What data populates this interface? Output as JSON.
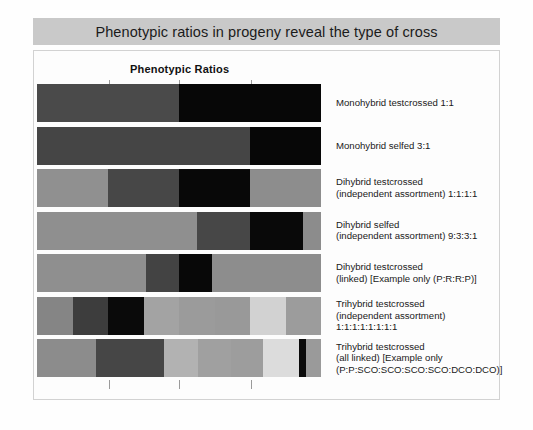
{
  "title": "Phenotypic ratios in progeny reveal the type of cross",
  "chart_heading": "Phenotypic Ratios",
  "colors": {
    "banner_bg": "#c9c9c9",
    "panel_bg": "#fdfdfd",
    "panel_border": "#d2d2d2",
    "tick": "#9a9a9a",
    "text": "#1a1a1a"
  },
  "axis": {
    "tick_positions_px": [
      108,
      178,
      250
    ],
    "bar_left_px": 36,
    "bar_right_px": 320,
    "tick_labels": []
  },
  "chart_data": {
    "type": "bar",
    "orientation": "horizontal-stacked",
    "title": "Phenotypic Ratios",
    "xlabel": "",
    "ylabel": "",
    "grid": false,
    "legend": "none",
    "categories": [
      "Monohybrid testcrossed 1:1",
      "Monohybrid selfed 3:1",
      "Dihybrid testcrossed (independent assortment) 1:1:1:1",
      "Dihybrid selfed (independent assortment) 9:3:3:1",
      "Dihybrid testcrossed (linked) [Example only (P:R:R:P)]",
      "Trihybrid testcrossed (independent assortment) 1:1:1:1:1:1:1:1",
      "Trihybrid testcrossed (all linked) [Example only (P:P:SCO:SCO:SCO:SCO:DCO:DCO)]"
    ],
    "rows": [
      {
        "label_lines": [
          "Monohybrid testcrossed 1:1"
        ],
        "ratio": "1:1",
        "segments": [
          {
            "fraction": 0.5,
            "color": "#4a4a4a"
          },
          {
            "fraction": 0.5,
            "color": "#070707"
          }
        ]
      },
      {
        "label_lines": [
          "Monohybrid selfed 3:1"
        ],
        "ratio": "3:1",
        "segments": [
          {
            "fraction": 0.75,
            "color": "#454545"
          },
          {
            "fraction": 0.25,
            "color": "#070707"
          }
        ]
      },
      {
        "label_lines": [
          "Dihybrid testcrossed",
          "(independent assortment) 1:1:1:1"
        ],
        "ratio": "1:1:1:1",
        "segments": [
          {
            "fraction": 0.25,
            "color": "#909090"
          },
          {
            "fraction": 0.25,
            "color": "#474747"
          },
          {
            "fraction": 0.25,
            "color": "#080808"
          },
          {
            "fraction": 0.25,
            "color": "#8d8d8d"
          }
        ]
      },
      {
        "label_lines": [
          "Dihybrid selfed",
          "(independent assortment) 9:3:3:1"
        ],
        "ratio": "9:3:3:1",
        "segments": [
          {
            "fraction": 0.5625,
            "color": "#8f8f8f"
          },
          {
            "fraction": 0.1875,
            "color": "#474747"
          },
          {
            "fraction": 0.1875,
            "color": "#090909"
          },
          {
            "fraction": 0.0625,
            "color": "#8c8c8c"
          }
        ]
      },
      {
        "label_lines": [
          "Dihybrid testcrossed",
          "(linked) [Example only (P:R:R:P)]"
        ],
        "ratio": "P:R:R:P",
        "segments": [
          {
            "fraction": 0.385,
            "color": "#8f8f8f"
          },
          {
            "fraction": 0.115,
            "color": "#434343"
          },
          {
            "fraction": 0.115,
            "color": "#080808"
          },
          {
            "fraction": 0.385,
            "color": "#8d8d8d"
          }
        ]
      },
      {
        "label_lines": [
          "Trihybrid testcrossed",
          "(independent assortment)",
          "1:1:1:1:1:1:1:1"
        ],
        "ratio": "1:1:1:1:1:1:1:1",
        "segments": [
          {
            "fraction": 0.125,
            "color": "#858585"
          },
          {
            "fraction": 0.125,
            "color": "#3d3d3d"
          },
          {
            "fraction": 0.125,
            "color": "#0a0a0a"
          },
          {
            "fraction": 0.125,
            "color": "#a3a3a3"
          },
          {
            "fraction": 0.125,
            "color": "#9b9b9b"
          },
          {
            "fraction": 0.125,
            "color": "#999999"
          },
          {
            "fraction": 0.125,
            "color": "#d2d2d2"
          },
          {
            "fraction": 0.125,
            "color": "#9c9c9c"
          }
        ]
      },
      {
        "label_lines": [
          "Trihybrid testcrossed",
          "(all linked) [Example only",
          "(P:P:SCO:SCO:SCO:SCO:DCO:DCO)]"
        ],
        "ratio": "P:P:SCO:SCO:SCO:SCO:DCO:DCO",
        "segments": [
          {
            "fraction": 0.208,
            "color": "#8c8c8c"
          },
          {
            "fraction": 0.239,
            "color": "#464646"
          },
          {
            "fraction": 0.12,
            "color": "#b2b2b2"
          },
          {
            "fraction": 0.116,
            "color": "#a0a0a0"
          },
          {
            "fraction": 0.113,
            "color": "#9d9d9d"
          },
          {
            "fraction": 0.127,
            "color": "#dcdcdc"
          },
          {
            "fraction": 0.025,
            "color": "#0a0a0a"
          },
          {
            "fraction": 0.052,
            "color": "#9a9a9a"
          }
        ]
      }
    ]
  }
}
